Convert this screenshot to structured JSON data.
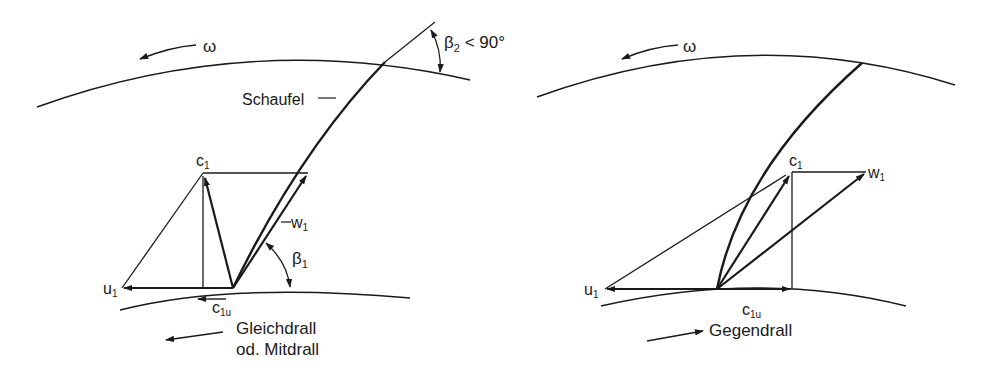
{
  "left_diagram": {
    "omega": "ω",
    "beta2_label": "β",
    "beta2_sub": "2",
    "beta2_cond": " < 90°",
    "schaufel": "Schaufel",
    "c1": "c",
    "c1_sub": "1",
    "w1": "w",
    "w1_sub": "1",
    "u1": "u",
    "u1_sub": "1",
    "beta1": "β",
    "beta1_sub": "1",
    "c1u": "c",
    "c1u_sub": "1u",
    "caption_line1": "Gleichdrall",
    "caption_line2": "od. Mitdrall"
  },
  "right_diagram": {
    "omega": "ω",
    "c1": "c",
    "c1_sub": "1",
    "w1": "w",
    "w1_sub": "1",
    "u1": "u",
    "u1_sub": "1",
    "c1u": "c",
    "c1u_sub": "1u",
    "caption": "Gegendrall"
  },
  "colors": {
    "stroke": "#1a1a1a",
    "background": "#ffffff"
  }
}
